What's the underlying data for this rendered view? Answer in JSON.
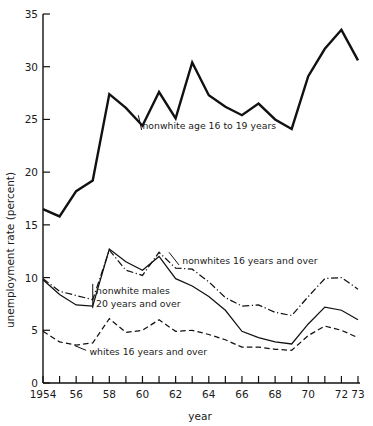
{
  "chart_data": {
    "type": "line",
    "title": "",
    "xlabel": "year",
    "ylabel": "unemployment rate (percent)",
    "xlim": [
      1954,
      1973
    ],
    "ylim": [
      0,
      35
    ],
    "grid": false,
    "legend_position": "inline-annotations",
    "x": [
      1954,
      1955,
      1956,
      1957,
      1958,
      1959,
      1960,
      1961,
      1962,
      1963,
      1964,
      1965,
      1966,
      1967,
      1968,
      1969,
      1970,
      1971,
      1972,
      1973
    ],
    "y_ticks": [
      0,
      5,
      10,
      15,
      20,
      25,
      30,
      35
    ],
    "y_tick_labels": [
      "0",
      "5",
      "10",
      "15",
      "20",
      "25",
      "30",
      "35"
    ],
    "x_ticks": [
      1954,
      1955,
      1956,
      1957,
      1958,
      1959,
      1960,
      1961,
      1962,
      1963,
      1964,
      1965,
      1966,
      1967,
      1968,
      1969,
      1970,
      1971,
      1972,
      1973
    ],
    "x_tick_labels": [
      {
        "value": 1954,
        "label": "1954"
      },
      {
        "value": 1956,
        "label": "56"
      },
      {
        "value": 1958,
        "label": "58"
      },
      {
        "value": 1960,
        "label": "60"
      },
      {
        "value": 1962,
        "label": "62"
      },
      {
        "value": 1964,
        "label": "64"
      },
      {
        "value": 1966,
        "label": "66"
      },
      {
        "value": 1968,
        "label": "68"
      },
      {
        "value": 1970,
        "label": "70"
      },
      {
        "value": 1972,
        "label": "72"
      },
      {
        "value": 1973,
        "label": "73"
      }
    ],
    "series": [
      {
        "name": "nonwhite age 16 to 19 years",
        "style": "solid-thick",
        "values": [
          16.5,
          15.8,
          18.2,
          19.2,
          27.4,
          26.1,
          24.4,
          27.6,
          25.1,
          30.4,
          27.3,
          26.2,
          25.4,
          26.5,
          25.0,
          24.1,
          29.1,
          31.7,
          33.5,
          30.6
        ]
      },
      {
        "name": "nonwhites  16 years and over",
        "style": "dash-dot",
        "values": [
          9.9,
          8.7,
          8.3,
          7.9,
          12.6,
          10.7,
          10.2,
          12.4,
          10.9,
          10.8,
          9.6,
          8.1,
          7.3,
          7.4,
          6.7,
          6.4,
          8.2,
          9.9,
          10.0,
          8.9
        ]
      },
      {
        "name": "nonwhite males 20 years and over",
        "style": "solid-thin",
        "values": [
          9.8,
          8.4,
          7.4,
          7.3,
          12.7,
          11.5,
          10.7,
          12.0,
          9.9,
          9.2,
          8.2,
          6.9,
          4.9,
          4.3,
          3.9,
          3.7,
          5.6,
          7.2,
          6.9,
          6.0
        ]
      },
      {
        "name": "whites 16 years and over",
        "style": "dashed",
        "values": [
          4.9,
          3.9,
          3.6,
          3.8,
          6.1,
          4.8,
          5.0,
          6.0,
          4.9,
          5.0,
          4.6,
          4.1,
          3.4,
          3.4,
          3.2,
          3.1,
          4.5,
          5.4,
          5.0,
          4.3
        ]
      }
    ],
    "annotations": [
      {
        "id": "ann-teen",
        "text": "nonwhite age 16 to 19 years",
        "x": 1960.0,
        "y": 24.4
      },
      {
        "id": "ann-nonwhites",
        "text": "nonwhites  16 years and over",
        "x": 1962.4,
        "y": 11.6
      },
      {
        "id": "ann-males-1",
        "text": "nonwhite males",
        "x": 1957.2,
        "y": 8.7
      },
      {
        "id": "ann-males-2",
        "text": "20 years and over",
        "x": 1957.2,
        "y": 7.5
      },
      {
        "id": "ann-whites",
        "text": "whites 16 years and over",
        "x": 1956.8,
        "y": 2.9
      }
    ],
    "colors": {
      "line": "#111111",
      "background": "#ffffff",
      "text": "#1a1a1a"
    }
  }
}
